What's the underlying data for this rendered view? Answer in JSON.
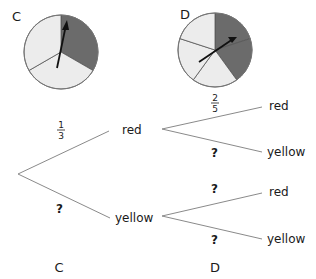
{
  "colors": {
    "red_sector": "#6b6b6b",
    "yellow_sector": "#ececec",
    "outline": "#777777",
    "branch": "#8a8a8a",
    "arrow": "#111111"
  },
  "spinners": [
    {
      "id": "C",
      "label": "C",
      "sectors": [
        "red",
        "yellow",
        "yellow"
      ],
      "red_fraction": "1/3"
    },
    {
      "id": "D",
      "label": "D",
      "sectors": [
        "red",
        "red",
        "yellow",
        "yellow",
        "yellow"
      ],
      "red_fraction": "2/5"
    }
  ],
  "tree": {
    "first": {
      "red": {
        "label": "red",
        "prob_num": "1",
        "prob_den": "3"
      },
      "yellow": {
        "label": "yellow",
        "prob": "?"
      }
    },
    "second_after_red": {
      "red": {
        "label": "red",
        "prob_num": "2",
        "prob_den": "5"
      },
      "yellow": {
        "label": "yellow",
        "prob": "?"
      }
    },
    "second_after_yellow": {
      "red": {
        "label": "red",
        "prob": "?"
      },
      "yellow": {
        "label": "yellow",
        "prob": "?"
      }
    },
    "column_labels": [
      "C",
      "D"
    ]
  }
}
